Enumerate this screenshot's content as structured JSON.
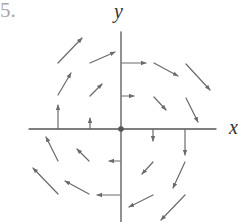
{
  "figure": {
    "number_label": "5.",
    "x_axis_label": "x",
    "y_axis_label": "y",
    "colors": {
      "axes": "#555555",
      "arrows": "#6a6a6a",
      "number_label": "#a8a8a8"
    }
  },
  "chart_data": {
    "type": "vector_field",
    "title": "",
    "xlabel": "x",
    "ylabel": "y",
    "grid": false,
    "origin_px": [
      121,
      129
    ],
    "unit_px": 32,
    "vectors": [
      {
        "x": -2,
        "y": 2,
        "dx": 1,
        "dy": 1,
        "px": [
          58,
          63,
          82,
          38
        ]
      },
      {
        "x": -1,
        "y": 2,
        "dx": 2,
        "dy": 1,
        "px": [
          90,
          63,
          115,
          52
        ]
      },
      {
        "x": -2,
        "y": 1,
        "dx": 1,
        "dy": 2,
        "px": [
          58,
          95,
          71,
          73
        ]
      },
      {
        "x": -1,
        "y": 1,
        "dx": 1,
        "dy": 1,
        "px": [
          90,
          96,
          102,
          84
        ]
      },
      {
        "x": -2,
        "y": 0,
        "dx": 0,
        "dy": 2,
        "px": [
          58,
          129,
          58,
          105
        ]
      },
      {
        "x": -1,
        "y": 0,
        "dx": 0,
        "dy": 1,
        "px": [
          90,
          129,
          90,
          118
        ]
      },
      {
        "x": 0,
        "y": 2,
        "dx": 2,
        "dy": 0,
        "px": [
          122,
          63,
          146,
          63
        ]
      },
      {
        "x": 1,
        "y": 2,
        "dx": 2,
        "dy": -1,
        "px": [
          154,
          63,
          178,
          76
        ]
      },
      {
        "x": 2,
        "y": 2,
        "dx": 1,
        "dy": -1,
        "px": [
          186,
          64,
          210,
          90
        ]
      },
      {
        "x": 0,
        "y": 1,
        "dx": 1,
        "dy": 0,
        "px": [
          122,
          96,
          134,
          96
        ]
      },
      {
        "x": 1,
        "y": 1,
        "dx": 1,
        "dy": -1,
        "px": [
          154,
          97,
          166,
          110
        ]
      },
      {
        "x": 2,
        "y": 1,
        "dx": 1,
        "dy": -2,
        "px": [
          186,
          98,
          198,
          122
        ]
      },
      {
        "x": 1,
        "y": 0,
        "dx": 0,
        "dy": -1,
        "px": [
          153,
          129,
          153,
          141
        ]
      },
      {
        "x": 2,
        "y": 0,
        "dx": 0,
        "dy": -2,
        "px": [
          185,
          129,
          185,
          155
        ]
      },
      {
        "x": 1,
        "y": -1,
        "dx": -1,
        "dy": -1,
        "px": [
          153,
          162,
          142,
          174
        ]
      },
      {
        "x": 2,
        "y": -1,
        "dx": -1,
        "dy": -2,
        "px": [
          185,
          162,
          173,
          188
        ]
      },
      {
        "x": 1,
        "y": -2,
        "dx": -2,
        "dy": -1,
        "px": [
          153,
          195,
          129,
          207
        ]
      },
      {
        "x": 2,
        "y": -2,
        "dx": -1,
        "dy": -1,
        "px": [
          185,
          195,
          161,
          220
        ]
      },
      {
        "x": -2,
        "y": -1,
        "dx": -1,
        "dy": 2,
        "px": [
          58,
          161,
          46,
          137
        ]
      },
      {
        "x": -1,
        "y": -1,
        "dx": -1,
        "dy": 1,
        "px": [
          89,
          161,
          77,
          149
        ]
      },
      {
        "x": 0,
        "y": -1,
        "dx": -1,
        "dy": 0,
        "px": [
          120,
          161,
          109,
          161
        ]
      },
      {
        "x": -2,
        "y": -2,
        "dx": -1,
        "dy": 1,
        "px": [
          58,
          194,
          33,
          168
        ]
      },
      {
        "x": -1,
        "y": -2,
        "dx": -2,
        "dy": 1,
        "px": [
          89,
          194,
          65,
          181
        ]
      },
      {
        "x": 0,
        "y": -2,
        "dx": -2,
        "dy": 0,
        "px": [
          120,
          195,
          97,
          195
        ]
      }
    ],
    "axes_px": {
      "x_axis": [
        29,
        129,
        216,
        129
      ],
      "y_axis": [
        121,
        32,
        121,
        222
      ]
    }
  }
}
